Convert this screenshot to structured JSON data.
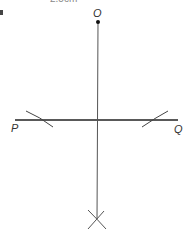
{
  "diagram": {
    "type": "geometric-construction",
    "top_label_clipped": {
      "text": "2.5cm",
      "note": "partially cut off at top edge; best-effort reading, not verified"
    },
    "labels": {
      "O": "O",
      "P": "P",
      "Q": "Q"
    },
    "points": {
      "O": {
        "x": 98,
        "y": 22
      },
      "P_end": {
        "x": 15,
        "y": 120
      },
      "Q_end": {
        "x": 178,
        "y": 120
      },
      "intersection_mark": {
        "x": 97,
        "y": 219
      }
    },
    "colors": {
      "line_main": "#222222",
      "line_perpendicular": "#555555",
      "arcs": "#444444",
      "label": "#333333"
    }
  }
}
